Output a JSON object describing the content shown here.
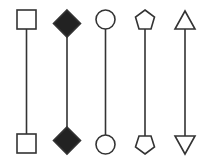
{
  "diagram": {
    "stroke_color": "#333333",
    "fill_color": "#ffffff",
    "filled_color": "#222222",
    "connectors": [
      {
        "name": "square",
        "top": "square-open",
        "bottom": "square-open",
        "x": 26
      },
      {
        "name": "diamond",
        "top": "diamond-filled",
        "bottom": "diamond-filled",
        "x": 67
      },
      {
        "name": "circle",
        "top": "circle-open",
        "bottom": "circle-open",
        "x": 105
      },
      {
        "name": "pentagon",
        "top": "pentagon-open",
        "bottom": "pentagon-open",
        "x": 145
      },
      {
        "name": "triangle",
        "top": "triangle-up-open",
        "bottom": "triangle-down-open",
        "x": 185
      }
    ]
  }
}
